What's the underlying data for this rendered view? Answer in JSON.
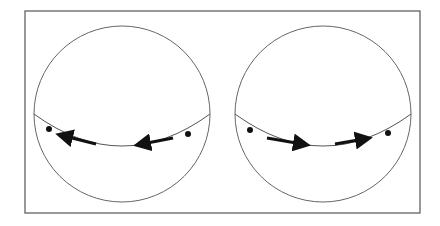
{
  "diagram": {
    "frame": {
      "x": 25,
      "y": 11,
      "width": 395,
      "height": 202,
      "stroke": "#555555"
    },
    "spheres": [
      {
        "id": "left",
        "center": [
          122,
          114
        ],
        "radius": 88,
        "equator_drop": 32,
        "dots": [
          [
            49,
            131
          ],
          [
            188,
            134
          ]
        ],
        "arrows": [
          {
            "from": [
              96,
              145
            ],
            "to": [
              61,
              136
            ],
            "direction": "left"
          },
          {
            "from": [
              173,
              139
            ],
            "to": [
              139,
              145
            ],
            "direction": "left"
          }
        ]
      },
      {
        "id": "right",
        "center": [
          323,
          114
        ],
        "radius": 88,
        "equator_drop": 32,
        "dots": [
          [
            250,
            131
          ],
          [
            388,
            134
          ]
        ],
        "arrows": [
          {
            "from": [
              267,
              138
            ],
            "to": [
              305,
              145
            ],
            "direction": "right"
          },
          {
            "from": [
              335,
              145
            ],
            "to": [
              367,
              139
            ],
            "direction": "right"
          }
        ]
      }
    ],
    "colors": {
      "line": "#555555",
      "arrow": "#111111",
      "dot": "#111111"
    }
  }
}
